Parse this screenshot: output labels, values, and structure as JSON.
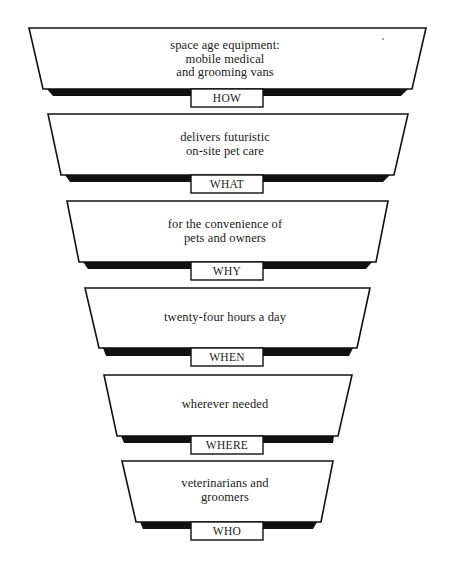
{
  "diagram": {
    "title": "",
    "tiers": [
      {
        "label": "HOW",
        "lines": [
          "space age equipment:",
          "mobile medical",
          "and grooming vans"
        ],
        "top": 28,
        "bottom": 89,
        "top_left": 29,
        "top_right": 426,
        "bottom_left": 43,
        "bottom_right": 412,
        "shadow_left": 53,
        "shadow_right": 401,
        "shadow_bottom": 96,
        "text_top": 39,
        "label_top": 89
      },
      {
        "label": "WHAT",
        "lines": [
          "delivers futuristic",
          "on-site pet care"
        ],
        "top": 114,
        "bottom": 175,
        "top_left": 48,
        "top_right": 408,
        "bottom_left": 61,
        "bottom_right": 394,
        "shadow_left": 70,
        "shadow_right": 383,
        "shadow_bottom": 182,
        "text_top": 131,
        "label_top": 175
      },
      {
        "label": "WHY",
        "lines": [
          "for the convenience of",
          "pets and owners"
        ],
        "top": 201,
        "bottom": 262,
        "top_left": 67,
        "top_right": 388,
        "bottom_left": 79,
        "bottom_right": 376,
        "shadow_left": 88,
        "shadow_right": 366,
        "shadow_bottom": 269,
        "text_top": 218,
        "label_top": 262
      },
      {
        "label": "WHEN",
        "lines": [
          "twenty-four hours a day"
        ],
        "top": 288,
        "bottom": 348,
        "top_left": 85,
        "top_right": 370,
        "bottom_left": 99,
        "bottom_right": 357,
        "shadow_left": 106,
        "shadow_right": 349,
        "shadow_bottom": 356,
        "text_top": 311,
        "label_top": 348
      },
      {
        "label": "WHERE",
        "lines": [
          "wherever needed"
        ],
        "top": 375,
        "bottom": 436,
        "top_left": 104,
        "top_right": 352,
        "bottom_left": 117,
        "bottom_right": 338,
        "shadow_left": 124,
        "shadow_right": 333,
        "shadow_bottom": 443,
        "text_top": 398,
        "label_top": 436
      },
      {
        "label": "WHO",
        "lines": [
          "veterinarians and",
          "groomers"
        ],
        "top": 461,
        "bottom": 522,
        "top_left": 122,
        "top_right": 333,
        "bottom_left": 136,
        "bottom_right": 321,
        "shadow_left": 143,
        "shadow_right": 313,
        "shadow_bottom": 529,
        "text_top": 477,
        "label_top": 522
      }
    ],
    "colors": {
      "stroke": "#111111",
      "shadow": "#111111",
      "fill": "#ffffff",
      "text": "#1a1a1a"
    }
  }
}
